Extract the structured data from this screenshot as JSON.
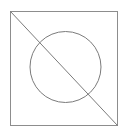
{
  "figure": {
    "background_color": "#ffffff",
    "canvas": {
      "width": 128,
      "height": 134
    },
    "shapes": [
      {
        "name": "square",
        "type": "rect",
        "x": 10.5,
        "y": 11.5,
        "width": 107,
        "height": 114,
        "stroke_color": "#8d8d8d",
        "stroke_width": 1,
        "fill": "none"
      },
      {
        "name": "circle",
        "type": "circle",
        "cx": 65.5,
        "cy": 67,
        "r": 35.5,
        "stroke_color": "#7b7b7b",
        "stroke_width": 1,
        "fill": "none"
      },
      {
        "name": "diagonal",
        "type": "line",
        "x1": 10.5,
        "y1": 11.5,
        "x2": 117.5,
        "y2": 125.5,
        "stroke_color": "#7b7b7b",
        "stroke_width": 1
      }
    ]
  }
}
